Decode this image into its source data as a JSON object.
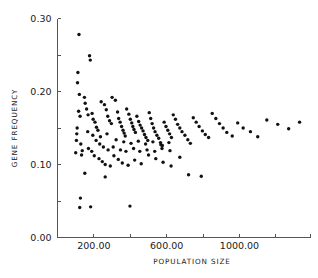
{
  "chart_data": {
    "type": "scatter",
    "title": "",
    "xlabel": "POPULATION SIZE",
    "ylabel": "GENE FREQUENCY",
    "xlim": [
      0,
      1390
    ],
    "ylim": [
      0.0,
      0.3
    ],
    "grid": false,
    "legend": null,
    "x_ticks_major": [
      200,
      600,
      1000
    ],
    "x_tick_labels": [
      "200.00",
      "600.00",
      "1000.00"
    ],
    "x_ticks_minor": [
      0,
      400,
      800,
      1200,
      1390
    ],
    "y_ticks_major": [
      0.0,
      0.1,
      0.2,
      0.3
    ],
    "y_tick_labels": [
      "0.00",
      "0.10",
      "0.20",
      "0.30"
    ],
    "y_ticks_minor": [
      0.05,
      0.15,
      0.25
    ],
    "marker": "dot",
    "marker_size": 1.7,
    "marker_color": "#111111",
    "points": [
      [
        118,
        0.278
      ],
      [
        112,
        0.226
      ],
      [
        110,
        0.212
      ],
      [
        176,
        0.249
      ],
      [
        180,
        0.243
      ],
      [
        120,
        0.196
      ],
      [
        148,
        0.192
      ],
      [
        152,
        0.184
      ],
      [
        116,
        0.173
      ],
      [
        124,
        0.166
      ],
      [
        108,
        0.15
      ],
      [
        106,
        0.142
      ],
      [
        104,
        0.133
      ],
      [
        128,
        0.128
      ],
      [
        136,
        0.119
      ],
      [
        132,
        0.113
      ],
      [
        100,
        0.116
      ],
      [
        160,
        0.176
      ],
      [
        168,
        0.168
      ],
      [
        190,
        0.17
      ],
      [
        196,
        0.162
      ],
      [
        206,
        0.158
      ],
      [
        214,
        0.151
      ],
      [
        222,
        0.147
      ],
      [
        240,
        0.186
      ],
      [
        258,
        0.182
      ],
      [
        268,
        0.175
      ],
      [
        276,
        0.166
      ],
      [
        286,
        0.16
      ],
      [
        296,
        0.156
      ],
      [
        300,
        0.192
      ],
      [
        318,
        0.188
      ],
      [
        330,
        0.172
      ],
      [
        336,
        0.163
      ],
      [
        344,
        0.158
      ],
      [
        352,
        0.152
      ],
      [
        360,
        0.147
      ],
      [
        366,
        0.143
      ],
      [
        372,
        0.139
      ],
      [
        380,
        0.176
      ],
      [
        392,
        0.169
      ],
      [
        400,
        0.162
      ],
      [
        408,
        0.157
      ],
      [
        414,
        0.152
      ],
      [
        420,
        0.148
      ],
      [
        428,
        0.144
      ],
      [
        436,
        0.166
      ],
      [
        446,
        0.159
      ],
      [
        454,
        0.154
      ],
      [
        462,
        0.15
      ],
      [
        470,
        0.146
      ],
      [
        478,
        0.141
      ],
      [
        486,
        0.137
      ],
      [
        496,
        0.133
      ],
      [
        504,
        0.171
      ],
      [
        512,
        0.163
      ],
      [
        520,
        0.156
      ],
      [
        528,
        0.15
      ],
      [
        536,
        0.145
      ],
      [
        546,
        0.14
      ],
      [
        556,
        0.136
      ],
      [
        566,
        0.13
      ],
      [
        576,
        0.126
      ],
      [
        586,
        0.158
      ],
      [
        596,
        0.152
      ],
      [
        606,
        0.147
      ],
      [
        616,
        0.142
      ],
      [
        626,
        0.137
      ],
      [
        636,
        0.168
      ],
      [
        648,
        0.162
      ],
      [
        660,
        0.155
      ],
      [
        672,
        0.15
      ],
      [
        684,
        0.145
      ],
      [
        700,
        0.14
      ],
      [
        716,
        0.134
      ],
      [
        730,
        0.129
      ],
      [
        746,
        0.164
      ],
      [
        762,
        0.158
      ],
      [
        778,
        0.152
      ],
      [
        796,
        0.146
      ],
      [
        812,
        0.141
      ],
      [
        830,
        0.137
      ],
      [
        850,
        0.17
      ],
      [
        870,
        0.163
      ],
      [
        890,
        0.156
      ],
      [
        910,
        0.15
      ],
      [
        930,
        0.144
      ],
      [
        960,
        0.139
      ],
      [
        990,
        0.157
      ],
      [
        1020,
        0.15
      ],
      [
        1060,
        0.145
      ],
      [
        1100,
        0.138
      ],
      [
        1150,
        0.161
      ],
      [
        1210,
        0.155
      ],
      [
        1270,
        0.149
      ],
      [
        1330,
        0.158
      ],
      [
        170,
        0.122
      ],
      [
        188,
        0.118
      ],
      [
        202,
        0.112
      ],
      [
        228,
        0.108
      ],
      [
        246,
        0.104
      ],
      [
        262,
        0.1
      ],
      [
        290,
        0.098
      ],
      [
        310,
        0.112
      ],
      [
        334,
        0.107
      ],
      [
        356,
        0.102
      ],
      [
        388,
        0.099
      ],
      [
        424,
        0.106
      ],
      [
        460,
        0.101
      ],
      [
        500,
        0.113
      ],
      [
        540,
        0.108
      ],
      [
        580,
        0.103
      ],
      [
        624,
        0.098
      ],
      [
        672,
        0.11
      ],
      [
        150,
        0.088
      ],
      [
        262,
        0.083
      ],
      [
        720,
        0.086
      ],
      [
        790,
        0.084
      ],
      [
        126,
        0.054
      ],
      [
        122,
        0.041
      ],
      [
        182,
        0.042
      ],
      [
        398,
        0.043
      ],
      [
        212,
        0.133
      ],
      [
        232,
        0.128
      ],
      [
        252,
        0.124
      ],
      [
        278,
        0.12
      ],
      [
        306,
        0.124
      ],
      [
        346,
        0.12
      ],
      [
        376,
        0.118
      ],
      [
        418,
        0.122
      ],
      [
        452,
        0.118
      ],
      [
        492,
        0.12
      ],
      [
        534,
        0.118
      ],
      [
        574,
        0.122
      ],
      [
        618,
        0.119
      ],
      [
        166,
        0.145
      ],
      [
        194,
        0.14
      ],
      [
        236,
        0.138
      ],
      [
        272,
        0.142
      ],
      [
        322,
        0.134
      ],
      [
        364,
        0.131
      ],
      [
        404,
        0.129
      ],
      [
        444,
        0.132
      ],
      [
        484,
        0.128
      ],
      [
        524,
        0.131
      ],
      [
        568,
        0.127
      ],
      [
        612,
        0.13
      ]
    ]
  }
}
